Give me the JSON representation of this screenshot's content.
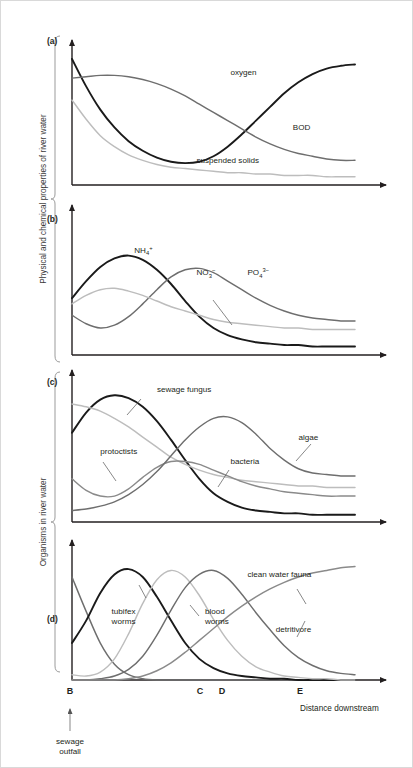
{
  "figure": {
    "bracket_labels": {
      "upper": "Physical and chemical properties of river water",
      "lower": "Organisms in river water"
    },
    "x_axis_title": "Distance downstream",
    "outfall_annotation_line1": "sewage",
    "outfall_annotation_line2": "outfall",
    "markers": [
      {
        "id": "marker-b",
        "label": "B",
        "x": 70
      },
      {
        "id": "marker-c",
        "label": "C",
        "x": 200
      },
      {
        "id": "marker-d",
        "label": "D",
        "x": 222
      },
      {
        "id": "marker-e",
        "label": "E",
        "x": 300
      }
    ],
    "panels": [
      {
        "id": "a",
        "label": "(a)"
      },
      {
        "id": "b",
        "label": "(b)"
      },
      {
        "id": "c",
        "label": "(c)"
      },
      {
        "id": "d",
        "label": "(d)"
      }
    ]
  },
  "colors": {
    "dark": "#1a1a1a",
    "mid": "#6e6e6e",
    "light": "#bdbdbd",
    "axis": "#231f20",
    "bracket": "#9b9b9b",
    "leader": "#555555"
  },
  "chart_data": [
    {
      "type": "line",
      "panel": "a",
      "title": "Physical and chemical properties of river water",
      "xlabel": "Distance downstream",
      "ylabel": "",
      "grid": false,
      "legend": "inline-labels",
      "xlim": [
        0,
        100
      ],
      "ylim": [
        0,
        100
      ],
      "x": [
        0,
        5,
        10,
        15,
        20,
        25,
        30,
        35,
        40,
        45,
        50,
        55,
        60,
        65,
        70,
        75,
        80,
        85,
        90,
        95,
        100
      ],
      "series": [
        {
          "name": "oxygen",
          "color": "#1a1a1a",
          "label_x": 56,
          "label_y": 80,
          "values": [
            92,
            72,
            55,
            42,
            32,
            25,
            20,
            17,
            16,
            17,
            21,
            28,
            37,
            47,
            57,
            67,
            75,
            81,
            85,
            87,
            88
          ]
        },
        {
          "name": "BOD",
          "color": "#6e6e6e",
          "label_x": 78,
          "label_y": 40,
          "values": [
            78,
            79,
            80,
            80,
            79,
            77,
            74,
            70,
            65,
            59,
            53,
            47,
            41,
            35,
            30,
            26,
            23,
            21,
            19,
            18,
            18
          ]
        },
        {
          "name": "suspended solids",
          "color": "#bdbdbd",
          "label_x": 44,
          "label_y": 16,
          "values": [
            62,
            48,
            36,
            28,
            22,
            18,
            15,
            13,
            12,
            11,
            10,
            9,
            9,
            8,
            8,
            7,
            7,
            7,
            6,
            6,
            6
          ]
        }
      ]
    },
    {
      "type": "line",
      "panel": "b",
      "title": "Nitrogen and phosphorus compounds",
      "xlabel": "Distance downstream",
      "ylabel": "",
      "grid": false,
      "legend": "inline-labels",
      "xlim": [
        0,
        100
      ],
      "ylim": [
        0,
        100
      ],
      "x": [
        0,
        5,
        10,
        15,
        20,
        25,
        30,
        35,
        40,
        45,
        50,
        55,
        60,
        65,
        70,
        75,
        80,
        85,
        90,
        95,
        100
      ],
      "series": [
        {
          "name": "NH4+",
          "label_html": "NH<sub>4</sub><sup>+</sup>",
          "color": "#1a1a1a",
          "label_x": 22,
          "label_y": 72,
          "values": [
            40,
            52,
            62,
            68,
            70,
            67,
            60,
            50,
            38,
            27,
            19,
            14,
            11,
            9,
            8,
            7,
            7,
            6,
            6,
            6,
            6
          ]
        },
        {
          "name": "NO3-",
          "label_html": "NO<sub>3</sub><sup>−</sup>",
          "color": "#6e6e6e",
          "label_x": 44,
          "label_y": 56,
          "values": [
            28,
            22,
            19,
            21,
            27,
            36,
            46,
            55,
            60,
            61,
            58,
            52,
            46,
            40,
            35,
            31,
            28,
            26,
            25,
            24,
            24
          ]
        },
        {
          "name": "PO43-",
          "label_html": "PO<sub>4</sub><sup>3−</sup>",
          "color": "#bdbdbd",
          "label_x": 62,
          "label_y": 56,
          "values": [
            36,
            42,
            46,
            47,
            45,
            42,
            38,
            34,
            31,
            28,
            25,
            23,
            22,
            21,
            20,
            19,
            19,
            18,
            18,
            18,
            18
          ]
        }
      ]
    },
    {
      "type": "line",
      "panel": "c",
      "title": "Microorganism populations",
      "xlabel": "Distance downstream",
      "ylabel": "Organisms in river water",
      "grid": false,
      "legend": "inline-labels",
      "xlim": [
        0,
        100
      ],
      "ylim": [
        0,
        100
      ],
      "x": [
        0,
        5,
        10,
        15,
        20,
        25,
        30,
        35,
        40,
        45,
        50,
        55,
        60,
        65,
        70,
        75,
        80,
        85,
        90,
        95,
        100
      ],
      "series": [
        {
          "name": "sewage fungus",
          "color": "#1a1a1a",
          "label_x": 30,
          "label_y": 90,
          "values": [
            62,
            76,
            85,
            88,
            86,
            80,
            70,
            57,
            43,
            30,
            20,
            14,
            10,
            8,
            7,
            6,
            6,
            5,
            5,
            5,
            5
          ]
        },
        {
          "name": "bacteria",
          "color": "#bdbdbd",
          "label_x": 56,
          "label_y": 40,
          "values": [
            82,
            80,
            77,
            72,
            66,
            59,
            52,
            45,
            40,
            36,
            33,
            31,
            29,
            28,
            27,
            26,
            25,
            25,
            24,
            24,
            24
          ]
        },
        {
          "name": "protoctists",
          "color": "#8a8a8a",
          "label_x": 10,
          "label_y": 47,
          "values": [
            30,
            22,
            18,
            18,
            23,
            31,
            38,
            42,
            42,
            40,
            36,
            32,
            28,
            25,
            23,
            21,
            20,
            19,
            18,
            18,
            18
          ]
        },
        {
          "name": "algae",
          "color": "#6e6e6e",
          "label_x": 80,
          "label_y": 57,
          "values": [
            8,
            9,
            11,
            14,
            19,
            26,
            35,
            46,
            57,
            66,
            72,
            73,
            69,
            61,
            51,
            43,
            37,
            34,
            33,
            32,
            32
          ]
        }
      ]
    },
    {
      "type": "line",
      "panel": "d",
      "title": "Invertebrate populations",
      "xlabel": "Distance downstream",
      "ylabel": "Organisms in river water",
      "grid": false,
      "legend": "inline-labels",
      "xlim": [
        0,
        100
      ],
      "ylim": [
        0,
        100
      ],
      "x": [
        0,
        5,
        10,
        15,
        20,
        25,
        30,
        35,
        40,
        45,
        50,
        55,
        60,
        65,
        70,
        75,
        80,
        85,
        90,
        95,
        100
      ],
      "series": [
        {
          "name": "clean-water-fauna-initial",
          "color": "#6e6e6e",
          "values": [
            78,
            52,
            28,
            12,
            4,
            1,
            0,
            0,
            0,
            0,
            0,
            0,
            0,
            0,
            0,
            0,
            0,
            0,
            0,
            0,
            0
          ]
        },
        {
          "name": "tubifex worms",
          "color": "#1a1a1a",
          "label_x": 14,
          "label_y": 50,
          "values": [
            28,
            45,
            66,
            80,
            84,
            78,
            63,
            45,
            28,
            16,
            9,
            5,
            3,
            2,
            1,
            1,
            0,
            0,
            0,
            0,
            0
          ]
        },
        {
          "name": "blood worms",
          "color": "#bdbdbd",
          "label_x": 47,
          "label_y": 50,
          "values": [
            4,
            3,
            6,
            16,
            35,
            58,
            76,
            83,
            78,
            64,
            46,
            30,
            18,
            10,
            6,
            3,
            2,
            1,
            1,
            0,
            0
          ]
        },
        {
          "name": "detritivore",
          "color": "#6e6e6e",
          "label_x": 72,
          "label_y": 36,
          "values": [
            0,
            0,
            1,
            3,
            8,
            18,
            34,
            53,
            70,
            80,
            83,
            77,
            65,
            51,
            38,
            26,
            17,
            11,
            7,
            5,
            4
          ]
        },
        {
          "name": "clean water fauna",
          "color": "#8a8a8a",
          "label_x": 62,
          "label_y": 78,
          "values": [
            0,
            0,
            0,
            0,
            1,
            3,
            7,
            13,
            21,
            30,
            39,
            48,
            56,
            63,
            69,
            74,
            78,
            81,
            83,
            85,
            86
          ]
        }
      ]
    }
  ]
}
